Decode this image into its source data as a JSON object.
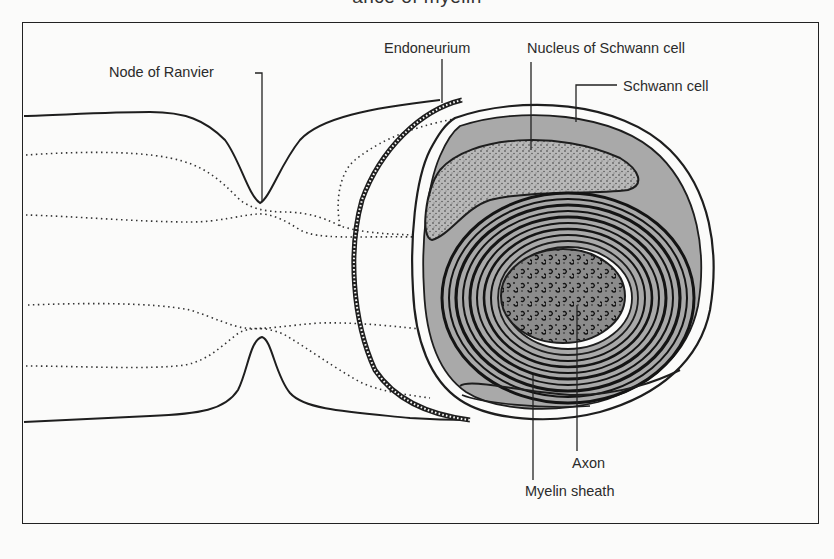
{
  "figure": {
    "title_partial": "ance of myelin",
    "labels": {
      "node_of_ranvier": "Node of Ranvier",
      "endoneurium": "Endoneurium",
      "nucleus_of_schwann_cell": "Nucleus of Schwann cell",
      "schwann_cell": "Schwann cell",
      "axon": "Axon",
      "myelin_sheath": "Myelin sheath"
    },
    "colors": {
      "line": "#1e1e1e",
      "schwann_fill": "#a9a9a9",
      "axon_fill": "#8f8f8f",
      "background": "#fbfbfa"
    }
  }
}
